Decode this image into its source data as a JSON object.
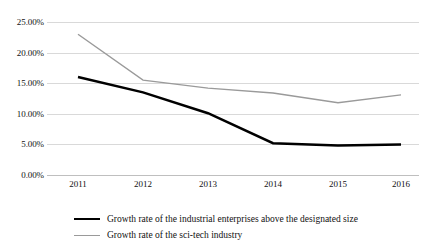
{
  "chart_data": {
    "type": "line",
    "title": "",
    "subtitle": "",
    "xlabel": "",
    "ylabel": "",
    "categories": [
      "2011",
      "2012",
      "2013",
      "2014",
      "2015",
      "2016"
    ],
    "x": [
      2011,
      2012,
      2013,
      2014,
      2015,
      2016
    ],
    "ylim": [
      0,
      25
    ],
    "ytick_values": [
      0,
      5,
      10,
      15,
      20,
      25
    ],
    "ytick_labels": [
      "0.00%",
      "5.00%",
      "10.00%",
      "15.00%",
      "20.00%",
      "25.00%"
    ],
    "grid": true,
    "legend_position": "bottom",
    "series": [
      {
        "name": "Growth rate of the industrial enterprises above the designated size",
        "color": "#000000",
        "width": 2.5,
        "values": [
          16.0,
          13.5,
          10.1,
          5.2,
          4.8,
          5.0
        ]
      },
      {
        "name": "Growth rate of the sci-tech industry",
        "color": "#9a9a9a",
        "width": 1.4,
        "values": [
          23.0,
          15.5,
          14.2,
          13.4,
          11.8,
          13.1
        ]
      }
    ]
  },
  "axes": {
    "y_ticks": [
      {
        "label": "25.00%",
        "value": 25
      },
      {
        "label": "20.00%",
        "value": 20
      },
      {
        "label": "15.00%",
        "value": 15
      },
      {
        "label": "10.00%",
        "value": 10
      },
      {
        "label": "5.00%",
        "value": 5
      },
      {
        "label": "0.00%",
        "value": 0
      }
    ],
    "x_ticks": [
      {
        "label": "2011"
      },
      {
        "label": "2012"
      },
      {
        "label": "2013"
      },
      {
        "label": "2014"
      },
      {
        "label": "2015"
      },
      {
        "label": "2016"
      }
    ]
  },
  "legend": {
    "items": [
      {
        "label": "Growth rate of the industrial enterprises above the designated size",
        "style": "thick"
      },
      {
        "label": "Growth rate of the sci-tech industry",
        "style": "thin"
      }
    ]
  }
}
